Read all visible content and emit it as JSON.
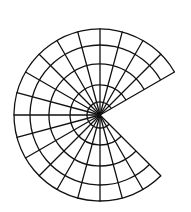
{
  "diagram": {
    "type": "polar-sector-grid",
    "background": "#ffffff",
    "stroke_color": "#111111",
    "stroke_width": 1.3,
    "center": {
      "x": 100,
      "y": 115
    },
    "outer_radius": 86,
    "ring_radii": [
      13,
      30,
      51,
      70,
      86
    ],
    "start_angle_deg": 30,
    "end_angle_deg": 315,
    "radial_step_deg": 15,
    "angle_convention": "degrees counter-clockwise from east",
    "opening": {
      "from_deg": -45,
      "to_deg": 30,
      "side": "right"
    }
  }
}
